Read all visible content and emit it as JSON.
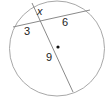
{
  "diagram": {
    "type": "circle-intersecting-chords",
    "colors": {
      "circle_stroke": "#a8a8a8",
      "chord_stroke": "#8a8a8a",
      "text": "#222222",
      "center_dot": "#111111",
      "background": "#ffffff"
    },
    "circle": {
      "cx": 57,
      "cy": 48.5,
      "r": 47.5
    },
    "chords": [
      {
        "name": "chord-horizontal",
        "x1": 13,
        "y1": 27,
        "x2": 90,
        "y2": 10
      },
      {
        "name": "chord-steep",
        "x1": 32,
        "y1": 3,
        "x2": 73,
        "y2": 92
      }
    ],
    "center_dot": {
      "cx": 58,
      "cy": 47,
      "r": 1.6
    },
    "labels": {
      "x": "x",
      "six": "6",
      "three": "3",
      "nine": "9"
    }
  }
}
